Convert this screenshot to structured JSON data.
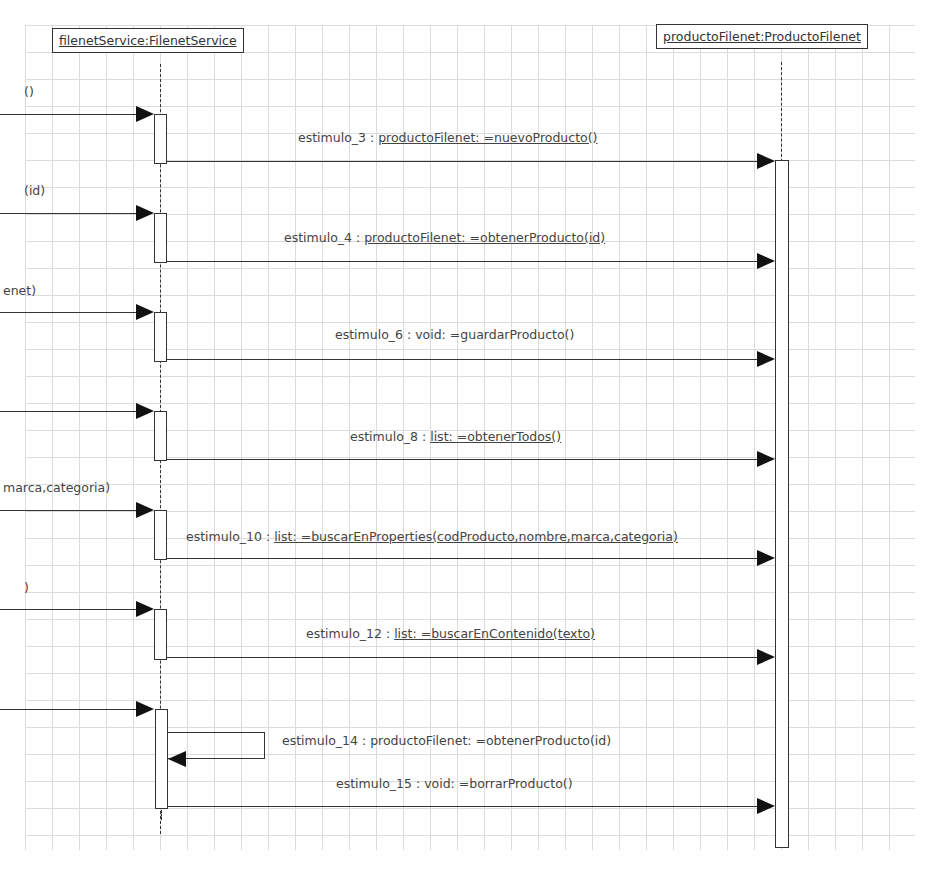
{
  "diagram": {
    "type": "UML sequence diagram",
    "lifelines": [
      {
        "id": "filenetService",
        "label": "filenetService:FilenetService"
      },
      {
        "id": "productoFilenet",
        "label": "productoFilenet:ProductoFilenet"
      }
    ],
    "incoming_labels": [
      "()",
      "(id)",
      "enet)",
      "",
      "marca,categoria)",
      ")",
      ""
    ],
    "messages": [
      {
        "name": "estimulo_3 : ",
        "sig": "productoFilenet: =nuevoProducto()",
        "underlined": true,
        "target": "productoFilenet"
      },
      {
        "name": "estimulo_4 : ",
        "sig": "productoFilenet: =obtenerProducto(id)",
        "underlined": true,
        "target": "productoFilenet"
      },
      {
        "name": "estimulo_6 : ",
        "sig": "void: =guardarProducto()",
        "underlined": false,
        "target": "productoFilenet"
      },
      {
        "name": "estimulo_8 : ",
        "sig": "list: =obtenerTodos()",
        "underlined": true,
        "target": "productoFilenet"
      },
      {
        "name": "estimulo_10 : ",
        "sig": "list: =buscarEnProperties(codProducto,nombre,marca,categoria)",
        "underlined": true,
        "target": "productoFilenet"
      },
      {
        "name": "estimulo_12 : ",
        "sig": "list: =buscarEnContenido(texto)",
        "underlined": true,
        "target": "productoFilenet"
      },
      {
        "name": "estimulo_14 : ",
        "sig": "productoFilenet: =obtenerProducto(id)",
        "underlined": false,
        "target": "self"
      },
      {
        "name": "estimulo_15 : ",
        "sig": "void: =borrarProducto()",
        "underlined": false,
        "target": "productoFilenet"
      }
    ]
  }
}
